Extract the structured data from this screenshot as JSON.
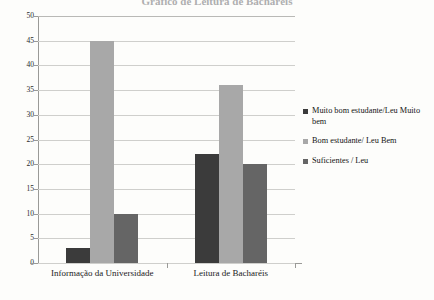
{
  "chart_data": {
    "type": "bar",
    "title": "Gráfico de Leitura de Bacharéis",
    "xlabel": "",
    "ylabel": "",
    "ylim": [
      0,
      50
    ],
    "ytick_step": 5,
    "yticks": [
      "50",
      "45",
      "40",
      "35",
      "30",
      "25",
      "20",
      "15",
      "10",
      "5",
      "0"
    ],
    "grid": true,
    "legend_position": "right",
    "categories": [
      "Informação da Universidade",
      "Leitura de Bacharéis"
    ],
    "series": [
      {
        "name": "Muito bom estudante/Leu Muito bem",
        "color": "#3b3b3b",
        "values": [
          3,
          22
        ]
      },
      {
        "name": "Bom estudante/ Leu Bem",
        "color": "#a8a8a8",
        "values": [
          45,
          36
        ]
      },
      {
        "name": "Suficientes / Leu",
        "color": "#656565",
        "values": [
          10,
          20
        ]
      }
    ]
  },
  "legend": {
    "items": [
      {
        "label": "Muito bom estudante/Leu Muito bem",
        "color": "#3b3b3b"
      },
      {
        "label": "Bom estudante/ Leu Bem",
        "color": "#a8a8a8"
      },
      {
        "label": "Suficientes / Leu",
        "color": "#656565"
      }
    ]
  },
  "axis": {
    "y_labels": [
      "50",
      "45",
      "40",
      "35",
      "30",
      "25",
      "20",
      "15",
      "10",
      "5",
      "0"
    ],
    "x_labels": [
      "Informação da Universidade",
      "Leitura de Bacharéis"
    ]
  },
  "colors": {
    "background": "#fdfdfb",
    "gridline": "#cfcfcc",
    "axis": "#9a9a97",
    "series_dark": "#3b3b3b",
    "series_light": "#a8a8a8",
    "series_mid": "#656565"
  }
}
